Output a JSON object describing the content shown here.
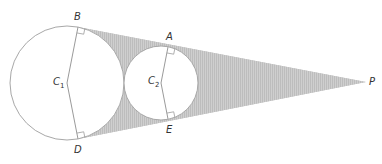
{
  "diagram": {
    "colors": {
      "background": "#ffffff",
      "shading": "#c8c8c8",
      "stroke": "#a8a8a8",
      "label": "#333333"
    },
    "points": {
      "B": {
        "label": "B",
        "x": 78,
        "y": 27
      },
      "D": {
        "label": "D",
        "x": 78,
        "y": 139
      },
      "A": {
        "label": "A",
        "x": 168,
        "y": 47
      },
      "E": {
        "label": "E",
        "x": 168,
        "y": 119
      },
      "P": {
        "label": "P",
        "x": 366,
        "y": 82
      },
      "C1": {
        "label": "C",
        "sub": "1",
        "x": 67,
        "y": 83
      },
      "C2": {
        "label": "C",
        "sub": "2",
        "x": 161,
        "y": 83
      }
    },
    "circles": [
      {
        "name": "large-circle",
        "center": "C1",
        "r": 57
      },
      {
        "name": "small-circle",
        "center": "C2",
        "r": 37
      }
    ],
    "right_angle_marks": [
      "B",
      "D",
      "A",
      "E"
    ]
  }
}
